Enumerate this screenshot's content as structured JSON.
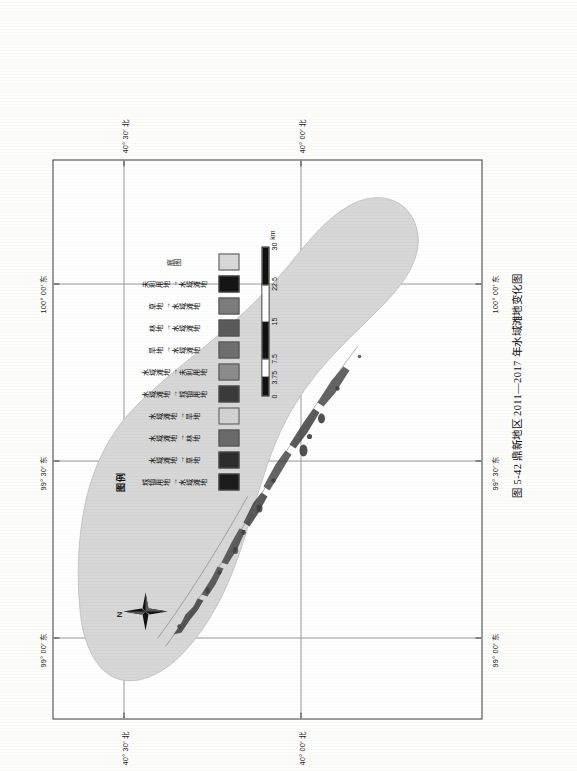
{
  "figure": {
    "caption": "图 5-42  鼎新地区 2011—2017 年水域滩地变化图"
  },
  "map": {
    "north_arrow_label": "N",
    "graticule": {
      "longitude_labels": [
        "99° 00′ 东",
        "99° 30′ 东",
        "100° 00′ 东"
      ],
      "latitude_labels": [
        "40° 00′ 北",
        "40° 30′ 北"
      ]
    }
  },
  "legend": {
    "title": "图例",
    "items": [
      {
        "label": "城镇用地→水域滩地",
        "color": "#1b1b1b"
      },
      {
        "label": "水域滩地→草地",
        "color": "#2c2c2c"
      },
      {
        "label": "水域滩地→林地",
        "color": "#6a6a6a"
      },
      {
        "label": "水域滩地→旱地",
        "color": "#d2d2d2"
      },
      {
        "label": "水域滩地→城镇用地",
        "color": "#3a3a3a"
      },
      {
        "label": "水域滩地→未利用地",
        "color": "#8c8c8c"
      },
      {
        "label": "旱地→水域滩地",
        "color": "#6f6f6f"
      },
      {
        "label": "林地→水域滩地",
        "color": "#5a5a5a"
      },
      {
        "label": "草地→水域滩地",
        "color": "#7d7d7d"
      },
      {
        "label": "未利用地→水域滩地",
        "color": "#151515"
      },
      {
        "label": "底图",
        "color": "#d8d8d8"
      }
    ]
  },
  "scalebar": {
    "unit": "km",
    "ticks": [
      "0",
      "3.75",
      "7.5",
      "15",
      "22.5",
      "30"
    ]
  }
}
